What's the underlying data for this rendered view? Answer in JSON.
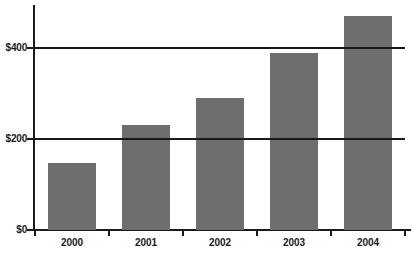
{
  "chart_data": {
    "type": "bar",
    "title": "",
    "subtitle": "",
    "xlabel": "",
    "ylabel": "",
    "categories": [
      "2000",
      "2001",
      "2002",
      "2003",
      "2004"
    ],
    "values": [
      147,
      230,
      290,
      390,
      470
    ],
    "series": [
      {
        "name": "",
        "values": [
          147,
          230,
          290,
          390,
          470
        ]
      }
    ],
    "ylim": [
      0,
      500
    ],
    "ytick_values": [
      0,
      200,
      400
    ],
    "ytick_labels": [
      "$0",
      "$200",
      "$400"
    ],
    "gridline_values": [
      200,
      400
    ],
    "grid": true,
    "legend": "none",
    "orientation": "vertical",
    "colors": {
      "bar_fill": "#6e6e6e",
      "axis": "#1a1a1a",
      "gridline": "#1a1a1a",
      "background": "#ffffff",
      "label_text": "#1a1a1a"
    }
  }
}
